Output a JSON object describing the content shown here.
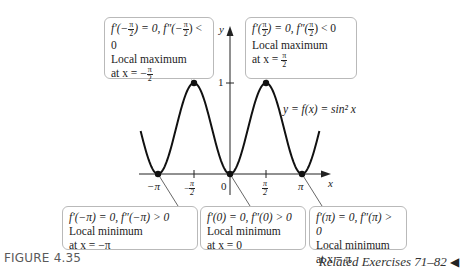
{
  "figure": {
    "label": "FIGURE 4.35",
    "related": "Related Exercises 71–82",
    "related_arrow": "◀"
  },
  "callouts": {
    "top_left": {
      "line1_pre": "f′(−",
      "frac_num": "π",
      "frac_den": "2",
      "line1_mid": ") = 0, f″(−",
      "line1_post": ") < 0",
      "line2": "Local maximum",
      "line3_pre": "at x = −"
    },
    "top_right": {
      "line1_pre": "f′(",
      "frac_num": "π",
      "frac_den": "2",
      "line1_mid": ") = 0, f″(",
      "line1_post": ") < 0",
      "line2": "Local maximum",
      "line3_pre": "at x = "
    },
    "bottom_left": {
      "line1": "f′(−π) = 0, f″(−π) > 0",
      "line2": "Local minimum",
      "line3": "at x = −π"
    },
    "bottom_mid": {
      "line1": "f′(0) = 0, f″(0) > 0",
      "line2": "Local minimum",
      "line3": "at x = 0"
    },
    "bottom_right": {
      "line1": "f′(π) = 0, f″(π) > 0",
      "line2": "Local minimum",
      "line3": "at x = π"
    }
  },
  "graph": {
    "y_axis_label": "y",
    "x_axis_label": "x",
    "y_tick_1": "1",
    "x_ticks": {
      "neg_pi": "−π",
      "neg_pi_half_num": "π",
      "neg_pi_half_den": "2",
      "zero": "0",
      "pi_half_num": "π",
      "pi_half_den": "2",
      "pi": "π"
    },
    "curve_label": "y = f(x) = sin² x"
  },
  "chart_data": {
    "type": "line",
    "title": "",
    "function": "y = f(x) = sin^2 x",
    "xlabel": "x",
    "ylabel": "y",
    "x_ticks": [
      "−π",
      "−π/2",
      "0",
      "π/2",
      "π"
    ],
    "y_ticks": [
      "1"
    ],
    "xlim": [
      -3.9,
      3.9
    ],
    "ylim": [
      0,
      1
    ],
    "series": [
      {
        "name": "sin^2 x",
        "x": [
          -3.9,
          -3.1416,
          -2.356,
          -1.5708,
          -0.785,
          0,
          0.785,
          1.5708,
          2.356,
          3.1416,
          3.9
        ],
        "values": [
          0.47,
          0,
          0.5,
          1,
          0.5,
          0,
          0.5,
          1,
          0.5,
          0,
          0.47
        ]
      }
    ],
    "marked_points": [
      {
        "x": "−π",
        "y": 0,
        "type": "local minimum"
      },
      {
        "x": "−π/2",
        "y": 1,
        "type": "local maximum"
      },
      {
        "x": "0",
        "y": 0,
        "type": "local minimum"
      },
      {
        "x": "π/2",
        "y": 1,
        "type": "local maximum"
      },
      {
        "x": "π",
        "y": 0,
        "type": "local minimum"
      }
    ]
  }
}
